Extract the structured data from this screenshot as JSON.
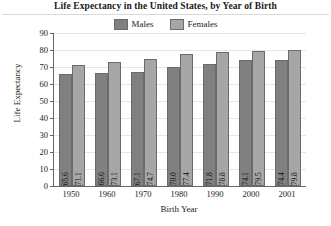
{
  "chart_data": {
    "type": "bar",
    "title": "Life Expectancy in the United States, by Year of Birth",
    "xlabel": "Birth Year",
    "ylabel": "Life Expectancy",
    "categories": [
      "1950",
      "1960",
      "1970",
      "1980",
      "1990",
      "2000",
      "2001"
    ],
    "series": [
      {
        "name": "Males",
        "color": "#808080",
        "values": [
          65.6,
          66.6,
          67.1,
          70.0,
          71.8,
          74.1,
          74.4
        ],
        "labels": [
          "65.6",
          "66.6",
          "67.1",
          "70.0",
          "71.8",
          "74.1",
          "74.4"
        ]
      },
      {
        "name": "Females",
        "color": "#a6a6a6",
        "values": [
          71.1,
          73.1,
          74.7,
          77.4,
          78.8,
          79.5,
          79.8
        ],
        "labels": [
          "71.1",
          "73.1",
          "74.7",
          "77.4",
          "78.8",
          "79.5",
          "79.8"
        ]
      }
    ],
    "ylim": [
      0,
      90
    ],
    "yticks": [
      0,
      10,
      20,
      30,
      40,
      50,
      60,
      70,
      80,
      90
    ],
    "ytick_labels": [
      "0",
      "10",
      "20",
      "30",
      "40",
      "50",
      "60",
      "70",
      "80",
      "90"
    ],
    "grid": true,
    "legend_position": "top-center",
    "axis_color": "#666666",
    "grid_color": "#e6e6e6",
    "background": "#ffffff"
  }
}
